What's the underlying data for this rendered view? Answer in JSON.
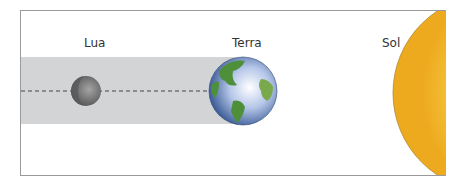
{
  "diagram": {
    "type": "lunar-eclipse-alignment",
    "labels": {
      "moon": "Lua",
      "earth": "Terra",
      "sun": "Sol"
    },
    "colors": {
      "shadow_band": "#d3d4d6",
      "dashed_line": "#444444",
      "sun": "#f5c43a",
      "earth_ocean": "#8fa8d8",
      "earth_land": "#4e8f3a",
      "moon": "#7a7a7a"
    }
  }
}
